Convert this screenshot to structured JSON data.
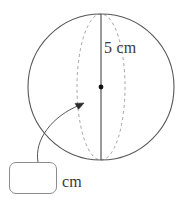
{
  "figure": {
    "type": "sphere-radius-diagram",
    "background_color": "#ffffff",
    "stroke_color": "#555555",
    "dashed_stroke_color": "#9a9a9a",
    "text_color": "#3a3a3a",
    "width": 184,
    "height": 201
  },
  "shapes": {
    "circle": {
      "name": "sphere-outline",
      "center_x": 101,
      "center_y": 87,
      "radius": 73
    },
    "equator_ellipse": {
      "name": "equator-ellipse",
      "center_x": 101,
      "center_y": 87,
      "radius_x": 24,
      "radius_y": 73,
      "dashed": true
    },
    "radius_line": {
      "name": "radius-line",
      "x1": 101,
      "y1": 14,
      "x2": 101,
      "y2": 160
    },
    "center_dot": {
      "name": "centre-dot",
      "cx": 101,
      "cy": 87,
      "r": 2.4
    },
    "pointer_arrow": {
      "name": "pointer-arrow",
      "start_x": 38,
      "start_y": 162,
      "end_x": 83,
      "end_y": 103,
      "control_x": 36,
      "control_y": 122
    }
  },
  "labels": {
    "radius": "5 cm",
    "unit": "cm"
  },
  "answer_box": {
    "value": "",
    "placeholder": ""
  }
}
